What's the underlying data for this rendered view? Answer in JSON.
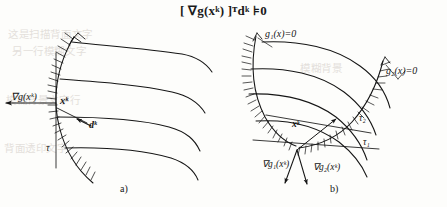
{
  "figure": {
    "title_formula": "[  ∇g(xᵏ) ]ᵀdᵏ ⊧0",
    "background_ghost_lines": [
      "这是扫描背面文字",
      "另一行模糊文字",
      "模糊背景",
      "模糊背景文字行",
      "背面透印文字"
    ],
    "panels": [
      {
        "id": "a",
        "caption": "a)",
        "labels": {
          "gradient": "∇g(xᵏ)",
          "point": "xᵏ",
          "direction": "dᵏ",
          "tangent": "τ"
        }
      },
      {
        "id": "b",
        "caption": "b)",
        "labels": {
          "constraint1": "g₁(x)=0",
          "constraint2": "g₂(x)=0",
          "point": "xᵏ",
          "gradient1": "∇g₁(xᵏ)",
          "gradient2": "∇g₂(xᵏ)",
          "tangent1": "τ₁",
          "tangent2": "τ₂"
        }
      }
    ],
    "colors": {
      "ink": "#151515",
      "paper": "#fdfdfb",
      "ghost": "#cfc8c2"
    }
  }
}
